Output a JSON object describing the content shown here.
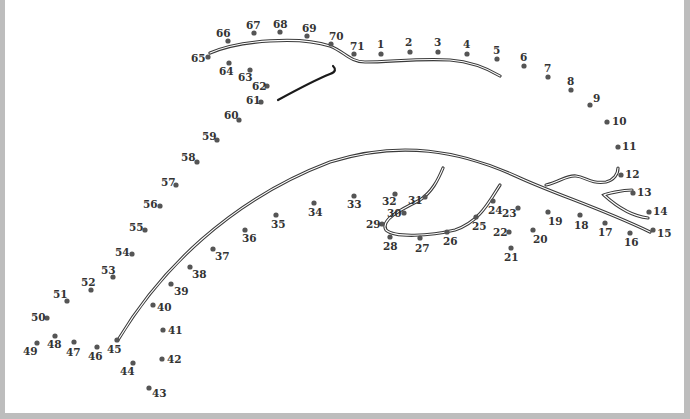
{
  "puzzle": {
    "type": "connect-the-dots",
    "subject": "dolphin",
    "dot_count": 71,
    "colors": {
      "dot": "#555555",
      "label": "#333333",
      "line": "#3a3a3a",
      "border": "#bdbdbd"
    },
    "dots": [
      {
        "n": "1",
        "x": 381,
        "y": 54,
        "lx": 377,
        "ly": 48
      },
      {
        "n": "2",
        "x": 410,
        "y": 52,
        "lx": 405,
        "ly": 46
      },
      {
        "n": "3",
        "x": 438,
        "y": 52,
        "lx": 434,
        "ly": 46
      },
      {
        "n": "4",
        "x": 467,
        "y": 54,
        "lx": 463,
        "ly": 48
      },
      {
        "n": "5",
        "x": 497,
        "y": 59,
        "lx": 493,
        "ly": 54
      },
      {
        "n": "6",
        "x": 524,
        "y": 66,
        "lx": 520,
        "ly": 61
      },
      {
        "n": "7",
        "x": 548,
        "y": 77,
        "lx": 544,
        "ly": 72
      },
      {
        "n": "8",
        "x": 571,
        "y": 90,
        "lx": 567,
        "ly": 85
      },
      {
        "n": "9",
        "x": 590,
        "y": 105,
        "lx": 593,
        "ly": 102
      },
      {
        "n": "10",
        "x": 607,
        "y": 122,
        "lx": 612,
        "ly": 125
      },
      {
        "n": "11",
        "x": 618,
        "y": 147,
        "lx": 622,
        "ly": 150
      },
      {
        "n": "12",
        "x": 621,
        "y": 175,
        "lx": 625,
        "ly": 178
      },
      {
        "n": "13",
        "x": 633,
        "y": 193,
        "lx": 637,
        "ly": 196
      },
      {
        "n": "14",
        "x": 649,
        "y": 212,
        "lx": 653,
        "ly": 215
      },
      {
        "n": "15",
        "x": 653,
        "y": 230,
        "lx": 657,
        "ly": 237
      },
      {
        "n": "16",
        "x": 630,
        "y": 233,
        "lx": 624,
        "ly": 246
      },
      {
        "n": "17",
        "x": 605,
        "y": 223,
        "lx": 598,
        "ly": 236
      },
      {
        "n": "18",
        "x": 580,
        "y": 215,
        "lx": 574,
        "ly": 229
      },
      {
        "n": "19",
        "x": 548,
        "y": 212,
        "lx": 548,
        "ly": 225
      },
      {
        "n": "20",
        "x": 533,
        "y": 230,
        "lx": 533,
        "ly": 243
      },
      {
        "n": "21",
        "x": 511,
        "y": 248,
        "lx": 504,
        "ly": 261
      },
      {
        "n": "22",
        "x": 509,
        "y": 232,
        "lx": 493,
        "ly": 236
      },
      {
        "n": "23",
        "x": 518,
        "y": 208,
        "lx": 502,
        "ly": 217
      },
      {
        "n": "24",
        "x": 493,
        "y": 201,
        "lx": 488,
        "ly": 214
      },
      {
        "n": "25",
        "x": 476,
        "y": 217,
        "lx": 472,
        "ly": 230
      },
      {
        "n": "26",
        "x": 447,
        "y": 232,
        "lx": 443,
        "ly": 245
      },
      {
        "n": "27",
        "x": 420,
        "y": 238,
        "lx": 415,
        "ly": 252
      },
      {
        "n": "28",
        "x": 390,
        "y": 237,
        "lx": 383,
        "ly": 250
      },
      {
        "n": "29",
        "x": 382,
        "y": 224,
        "lx": 366,
        "ly": 228
      },
      {
        "n": "30",
        "x": 404,
        "y": 213,
        "lx": 387,
        "ly": 217
      },
      {
        "n": "31",
        "x": 425,
        "y": 197,
        "lx": 408,
        "ly": 204
      },
      {
        "n": "32",
        "x": 395,
        "y": 194,
        "lx": 382,
        "ly": 205
      },
      {
        "n": "33",
        "x": 354,
        "y": 196,
        "lx": 347,
        "ly": 208
      },
      {
        "n": "34",
        "x": 314,
        "y": 203,
        "lx": 308,
        "ly": 216
      },
      {
        "n": "35",
        "x": 276,
        "y": 215,
        "lx": 271,
        "ly": 228
      },
      {
        "n": "36",
        "x": 245,
        "y": 230,
        "lx": 242,
        "ly": 242
      },
      {
        "n": "37",
        "x": 213,
        "y": 249,
        "lx": 215,
        "ly": 260
      },
      {
        "n": "38",
        "x": 190,
        "y": 267,
        "lx": 192,
        "ly": 278
      },
      {
        "n": "39",
        "x": 171,
        "y": 284,
        "lx": 174,
        "ly": 295
      },
      {
        "n": "40",
        "x": 153,
        "y": 305,
        "lx": 157,
        "ly": 311
      },
      {
        "n": "41",
        "x": 163,
        "y": 330,
        "lx": 168,
        "ly": 334
      },
      {
        "n": "42",
        "x": 162,
        "y": 359,
        "lx": 167,
        "ly": 363
      },
      {
        "n": "43",
        "x": 149,
        "y": 388,
        "lx": 152,
        "ly": 397
      },
      {
        "n": "44",
        "x": 133,
        "y": 363,
        "lx": 120,
        "ly": 375
      },
      {
        "n": "45",
        "x": 117,
        "y": 340,
        "lx": 107,
        "ly": 353
      },
      {
        "n": "46",
        "x": 97,
        "y": 347,
        "lx": 88,
        "ly": 360
      },
      {
        "n": "47",
        "x": 74,
        "y": 342,
        "lx": 66,
        "ly": 356
      },
      {
        "n": "48",
        "x": 55,
        "y": 336,
        "lx": 47,
        "ly": 348
      },
      {
        "n": "49",
        "x": 37,
        "y": 343,
        "lx": 23,
        "ly": 355
      },
      {
        "n": "50",
        "x": 47,
        "y": 318,
        "lx": 31,
        "ly": 321
      },
      {
        "n": "51",
        "x": 67,
        "y": 301,
        "lx": 53,
        "ly": 298
      },
      {
        "n": "52",
        "x": 91,
        "y": 290,
        "lx": 81,
        "ly": 286
      },
      {
        "n": "53",
        "x": 113,
        "y": 277,
        "lx": 101,
        "ly": 274
      },
      {
        "n": "54",
        "x": 132,
        "y": 254,
        "lx": 115,
        "ly": 256
      },
      {
        "n": "55",
        "x": 145,
        "y": 230,
        "lx": 129,
        "ly": 231
      },
      {
        "n": "56",
        "x": 160,
        "y": 206,
        "lx": 143,
        "ly": 208
      },
      {
        "n": "57",
        "x": 176,
        "y": 185,
        "lx": 161,
        "ly": 186
      },
      {
        "n": "58",
        "x": 197,
        "y": 162,
        "lx": 181,
        "ly": 161
      },
      {
        "n": "59",
        "x": 217,
        "y": 140,
        "lx": 202,
        "ly": 140
      },
      {
        "n": "60",
        "x": 239,
        "y": 120,
        "lx": 224,
        "ly": 119
      },
      {
        "n": "61",
        "x": 261,
        "y": 102,
        "lx": 246,
        "ly": 104
      },
      {
        "n": "62",
        "x": 267,
        "y": 86,
        "lx": 252,
        "ly": 90
      },
      {
        "n": "63",
        "x": 250,
        "y": 70,
        "lx": 238,
        "ly": 81
      },
      {
        "n": "64",
        "x": 229,
        "y": 63,
        "lx": 219,
        "ly": 75
      },
      {
        "n": "65",
        "x": 208,
        "y": 57,
        "lx": 191,
        "ly": 62
      },
      {
        "n": "66",
        "x": 228,
        "y": 41,
        "lx": 216,
        "ly": 37
      },
      {
        "n": "67",
        "x": 254,
        "y": 33,
        "lx": 246,
        "ly": 29
      },
      {
        "n": "68",
        "x": 280,
        "y": 32,
        "lx": 273,
        "ly": 28
      },
      {
        "n": "69",
        "x": 307,
        "y": 36,
        "lx": 302,
        "ly": 32
      },
      {
        "n": "70",
        "x": 331,
        "y": 44,
        "lx": 329,
        "ly": 40
      },
      {
        "n": "71",
        "x": 354,
        "y": 54,
        "lx": 350,
        "ly": 50
      }
    ]
  }
}
